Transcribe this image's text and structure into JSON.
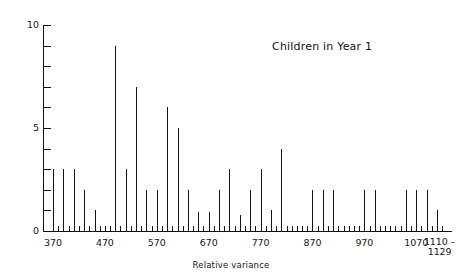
{
  "chart_data": {
    "type": "bar",
    "title": "Children in Year 1",
    "xlabel": "Relative variance",
    "ylabel": "",
    "xlim": [
      360,
      1129
    ],
    "ylim": [
      0,
      10
    ],
    "grid": false,
    "legend": "none",
    "y_ticks": [
      0,
      1,
      2,
      3,
      4,
      5,
      6,
      7,
      8,
      9,
      10
    ],
    "y_tick_labels": [
      {
        "value": 0,
        "label": "0"
      },
      {
        "value": 5,
        "label": "5"
      },
      {
        "value": 10,
        "label": "10"
      }
    ],
    "x_tick_labels": [
      {
        "value": 370,
        "label": "370"
      },
      {
        "value": 470,
        "label": "470"
      },
      {
        "value": 570,
        "label": "570"
      },
      {
        "value": 670,
        "label": "670"
      },
      {
        "value": 770,
        "label": "770"
      },
      {
        "value": 870,
        "label": "870"
      },
      {
        "value": 970,
        "label": "970"
      },
      {
        "value": 1070,
        "label": "1070"
      },
      {
        "value": 1115,
        "label": "1110 –",
        "label2": "1129"
      }
    ],
    "x_minor_tick_step": 10,
    "x": [
      370,
      390,
      410,
      430,
      450,
      470,
      490,
      510,
      530,
      550,
      570,
      590,
      610,
      630,
      650,
      670,
      690,
      710,
      730,
      750,
      770,
      790,
      810,
      830,
      850,
      870,
      890,
      910,
      930,
      950,
      970,
      990,
      1010,
      1030,
      1050,
      1070,
      1090,
      1110
    ],
    "values": [
      3,
      3,
      3,
      2,
      1,
      0.15,
      9,
      3,
      7,
      2,
      2,
      6,
      5,
      2,
      0.9,
      0.9,
      2,
      3,
      0.8,
      2,
      3,
      1,
      4,
      0.2,
      0.2,
      2,
      2,
      2,
      0.2,
      0.2,
      2,
      2,
      0.2,
      0.2,
      2,
      2,
      2,
      1
    ],
    "categories": [
      "370",
      "390",
      "410",
      "430",
      "450",
      "470",
      "490",
      "510",
      "530",
      "550",
      "570",
      "590",
      "610",
      "630",
      "650",
      "670",
      "690",
      "710",
      "730",
      "750",
      "770",
      "790",
      "810",
      "830",
      "850",
      "870",
      "890",
      "910",
      "930",
      "950",
      "970",
      "990",
      "1010",
      "1030",
      "1050",
      "1070",
      "1090",
      "1110"
    ]
  },
  "axes": {
    "y_label_10": "10",
    "y_label_5": "5",
    "y_label_0": "0"
  }
}
